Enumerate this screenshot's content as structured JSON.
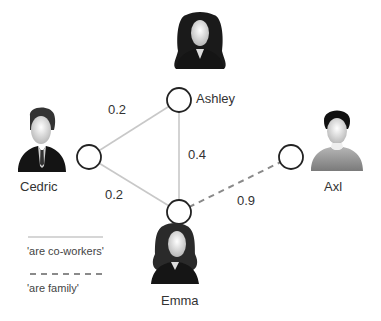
{
  "diagram": {
    "type": "weighted-graph",
    "nodes": [
      {
        "id": "ashley",
        "label": "Ashley",
        "avatar": "female-person-icon"
      },
      {
        "id": "cedric",
        "label": "Cedric",
        "avatar": "male-businessman-icon"
      },
      {
        "id": "emma",
        "label": "Emma",
        "avatar": "female-person-icon"
      },
      {
        "id": "axl",
        "label": "Axl",
        "avatar": "male-casual-person-icon"
      }
    ],
    "edges": [
      {
        "from": "cedric",
        "to": "ashley",
        "weight": "0.2",
        "relation": "are co-workers",
        "style": "solid"
      },
      {
        "from": "cedric",
        "to": "emma",
        "weight": "0.2",
        "relation": "are co-workers",
        "style": "solid"
      },
      {
        "from": "ashley",
        "to": "emma",
        "weight": "0.4",
        "relation": "are co-workers",
        "style": "solid"
      },
      {
        "from": "emma",
        "to": "axl",
        "weight": "0.9",
        "relation": "are family",
        "style": "dashed"
      }
    ],
    "legend": [
      {
        "label": "'are co-workers'",
        "style": "solid",
        "color": "#c8c8c8"
      },
      {
        "label": "'are family'",
        "style": "dashed",
        "color": "#8a8a8a"
      }
    ]
  }
}
